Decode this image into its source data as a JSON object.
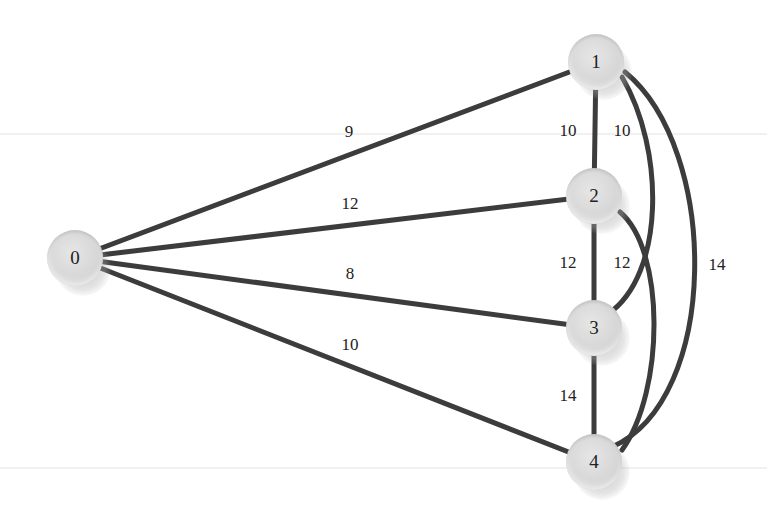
{
  "diagram": {
    "type": "weighted-undirected-graph",
    "guides": [
      134,
      468
    ],
    "edge_color": "#3c3c3c",
    "nodes": [
      {
        "id": "0",
        "label": "0",
        "x": 75,
        "y": 258
      },
      {
        "id": "1",
        "label": "1",
        "x": 596,
        "y": 62
      },
      {
        "id": "2",
        "label": "2",
        "x": 594,
        "y": 196
      },
      {
        "id": "3",
        "label": "3",
        "x": 594,
        "y": 328
      },
      {
        "id": "4",
        "label": "4",
        "x": 594,
        "y": 462
      }
    ],
    "edges": [
      {
        "from": "0",
        "to": "1",
        "weight": "9",
        "label_x": 349,
        "label_y": 132,
        "path": "M75,258 L596,62"
      },
      {
        "from": "0",
        "to": "2",
        "weight": "12",
        "label_x": 350,
        "label_y": 204,
        "path": "M75,258 L594,196"
      },
      {
        "from": "0",
        "to": "3",
        "weight": "8",
        "label_x": 350,
        "label_y": 274,
        "path": "M75,258 L594,328"
      },
      {
        "from": "0",
        "to": "4",
        "weight": "10",
        "label_x": 350,
        "label_y": 345,
        "path": "M75,258 L594,462"
      },
      {
        "from": "1",
        "to": "2",
        "weight": "10",
        "label_x": 568,
        "label_y": 131,
        "path": "M596,62 L594,196"
      },
      {
        "from": "1",
        "to": "3",
        "weight": "10",
        "label_x": 622,
        "label_y": 131,
        "path": "M622,77 C665,150 665,275 608,314"
      },
      {
        "from": "1",
        "to": "4",
        "weight": "14",
        "label_x": 717,
        "label_y": 265,
        "path": "M625,72 C720,150 720,400 612,447"
      },
      {
        "from": "2",
        "to": "3",
        "weight": "12",
        "label_x": 568,
        "label_y": 263,
        "path": "M594,196 L594,328"
      },
      {
        "from": "2",
        "to": "4",
        "weight": "12",
        "label_x": 622,
        "label_y": 263,
        "path": "M620,212 C665,250 665,390 622,450"
      },
      {
        "from": "3",
        "to": "4",
        "weight": "14",
        "label_x": 568,
        "label_y": 396,
        "path": "M594,328 L594,462"
      }
    ]
  }
}
